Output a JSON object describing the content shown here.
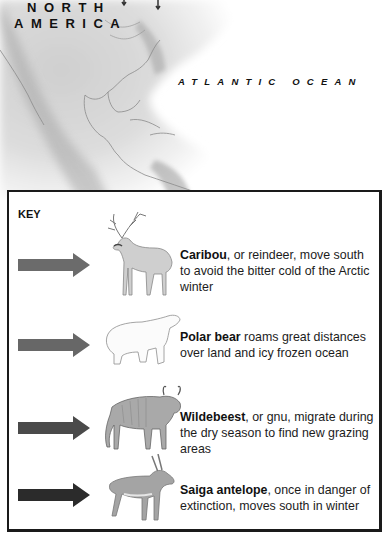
{
  "map": {
    "labels": {
      "continent_line1": "NORTH",
      "continent_line2": "AMERICA",
      "ocean": "ATLANTIC OCEAN"
    }
  },
  "key": {
    "title": "KEY",
    "entries": [
      {
        "animal": "caribou",
        "name": "Caribou",
        "text": ", or reindeer, move south to avoid the bitter cold of the Arctic winter",
        "arrow_color": "#6b6b6b"
      },
      {
        "animal": "polar-bear",
        "name": "Polar bear",
        "text": " roams great distances over land and icy frozen ocean",
        "arrow_color": "#676767"
      },
      {
        "animal": "wildebeest",
        "name": "Wildebeest",
        "text": ", or gnu, migrate during the dry season to find new grazing areas",
        "arrow_color": "#4a4a4a"
      },
      {
        "animal": "saiga-antelope",
        "name": "Saiga antelope",
        "text": ", once in danger of extinction, moves south in winter",
        "arrow_color": "#2b2b2b"
      }
    ]
  }
}
